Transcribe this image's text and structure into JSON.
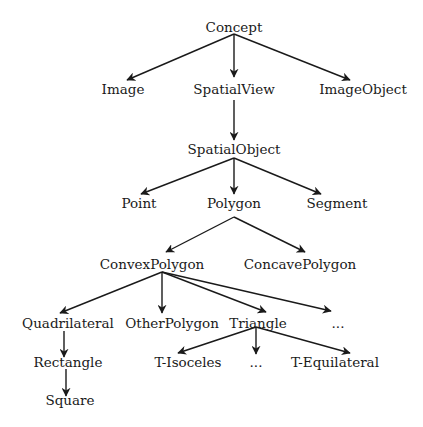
{
  "diagram": {
    "type": "class-hierarchy-tree",
    "colors": {
      "stroke": "#1a1a1a",
      "text": "#1a1a1a",
      "background": "#ffffff"
    },
    "nodes": [
      {
        "id": "concept",
        "label": "Concept",
        "x": 234,
        "y": 32
      },
      {
        "id": "image",
        "label": "Image",
        "x": 123,
        "y": 94
      },
      {
        "id": "spatialview",
        "label": "SpatialView",
        "x": 234,
        "y": 94
      },
      {
        "id": "imageobject",
        "label": "ImageObject",
        "x": 363,
        "y": 94
      },
      {
        "id": "spatialobject",
        "label": "SpatialObject",
        "x": 234,
        "y": 154
      },
      {
        "id": "point",
        "label": "Point",
        "x": 139,
        "y": 208
      },
      {
        "id": "polygon",
        "label": "Polygon",
        "x": 234,
        "y": 208
      },
      {
        "id": "segment",
        "label": "Segment",
        "x": 337,
        "y": 208
      },
      {
        "id": "convexpolygon",
        "label": "ConvexPolygon",
        "x": 152,
        "y": 269
      },
      {
        "id": "concavepolygon",
        "label": "ConcavePolygon",
        "x": 300,
        "y": 269
      },
      {
        "id": "quadrilateral",
        "label": "Quadrilateral",
        "x": 68,
        "y": 328
      },
      {
        "id": "otherpolygon",
        "label": "OtherPolygon",
        "x": 172,
        "y": 328
      },
      {
        "id": "triangle",
        "label": "Triangle",
        "x": 258,
        "y": 328
      },
      {
        "id": "polygon-more",
        "label": "...",
        "x": 338,
        "y": 328
      },
      {
        "id": "rectangle",
        "label": "Rectangle",
        "x": 68,
        "y": 367
      },
      {
        "id": "t-isoceles",
        "label": "T-Isoceles",
        "x": 188,
        "y": 367
      },
      {
        "id": "triangle-more",
        "label": "...",
        "x": 256,
        "y": 367
      },
      {
        "id": "t-equilateral",
        "label": "T-Equilateral",
        "x": 335,
        "y": 367
      },
      {
        "id": "square",
        "label": "Square",
        "x": 70,
        "y": 405
      }
    ],
    "edges": [
      {
        "from": "concept",
        "to": "image",
        "x1": 234,
        "y1": 34,
        "x2": 127,
        "y2": 80
      },
      {
        "from": "concept",
        "to": "spatialview",
        "x1": 234,
        "y1": 34,
        "x2": 234,
        "y2": 77
      },
      {
        "from": "concept",
        "to": "imageobject",
        "x1": 234,
        "y1": 34,
        "x2": 350,
        "y2": 80
      },
      {
        "from": "spatialview",
        "to": "spatialobject",
        "x1": 234,
        "y1": 100,
        "x2": 234,
        "y2": 140
      },
      {
        "from": "spatialobject",
        "to": "point",
        "x1": 234,
        "y1": 158,
        "x2": 141,
        "y2": 194
      },
      {
        "from": "spatialobject",
        "to": "polygon",
        "x1": 234,
        "y1": 158,
        "x2": 234,
        "y2": 194
      },
      {
        "from": "spatialobject",
        "to": "segment",
        "x1": 234,
        "y1": 158,
        "x2": 321,
        "y2": 194
      },
      {
        "from": "polygon",
        "to": "convexpolygon",
        "x1": 234,
        "y1": 217,
        "x2": 166,
        "y2": 252
      },
      {
        "from": "polygon",
        "to": "concavepolygon",
        "x1": 234,
        "y1": 217,
        "x2": 305,
        "y2": 252
      },
      {
        "from": "convexpolygon",
        "to": "quadrilateral",
        "x1": 162,
        "y1": 272,
        "x2": 60,
        "y2": 313
      },
      {
        "from": "convexpolygon",
        "to": "otherpolygon",
        "x1": 162,
        "y1": 272,
        "x2": 162,
        "y2": 313
      },
      {
        "from": "convexpolygon",
        "to": "triangle",
        "x1": 162,
        "y1": 272,
        "x2": 266,
        "y2": 312
      },
      {
        "from": "convexpolygon",
        "to": "polygon-more",
        "x1": 162,
        "y1": 272,
        "x2": 331,
        "y2": 311
      },
      {
        "from": "quadrilateral",
        "to": "rectangle",
        "x1": 64,
        "y1": 331,
        "x2": 64,
        "y2": 357
      },
      {
        "from": "rectangle",
        "to": "square",
        "x1": 66,
        "y1": 369,
        "x2": 66,
        "y2": 396
      },
      {
        "from": "triangle",
        "to": "t-isoceles",
        "x1": 256,
        "y1": 327,
        "x2": 178,
        "y2": 353
      },
      {
        "from": "triangle",
        "to": "triangle-more",
        "x1": 256,
        "y1": 327,
        "x2": 256,
        "y2": 354
      },
      {
        "from": "triangle",
        "to": "t-equilateral",
        "x1": 256,
        "y1": 327,
        "x2": 350,
        "y2": 353
      }
    ]
  }
}
